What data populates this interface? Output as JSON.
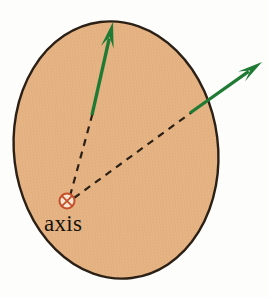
{
  "figure": {
    "kind": "physics-diagram",
    "title_text": "",
    "background_color": "#fdfdfb",
    "width": 268,
    "height": 298
  },
  "disk": {
    "name": "tilted-disk-ellipse",
    "fill_color": "#e7b485",
    "texture_color": "#d9a072",
    "stroke_color": "#2b2016",
    "stroke_width": 2.4,
    "center_x": 116,
    "center_y": 150,
    "radius_x": 102,
    "radius_y": 129,
    "rotation_deg": -7
  },
  "axis_marker": {
    "name": "rotation-axis-symbol",
    "glyph": "circle-with-x",
    "meaning": "axis-into-page",
    "x": 67,
    "y": 201,
    "radius": 7.5,
    "stroke_color": "#c4502a",
    "inner_color": "#c4502a",
    "fill_color": "#f7e4d2"
  },
  "labels": {
    "axis": "axis",
    "axis_x": 44,
    "axis_y": 231
  },
  "vectors": [
    {
      "name": "vector-arrow-1",
      "label": "",
      "color": "#1f7a34",
      "tail_x": 92,
      "tail_y": 115,
      "tip_x": 113,
      "tip_y": 22,
      "shaft_width": 3.4,
      "head_length": 26,
      "head_width": 13
    },
    {
      "name": "vector-arrow-2",
      "label": "",
      "color": "#1f7a34",
      "tail_x": 190,
      "tail_y": 113,
      "tip_x": 262,
      "tip_y": 62,
      "shaft_width": 3.2,
      "head_length": 25,
      "head_width": 12
    }
  ],
  "leader_lines": [
    {
      "name": "dashed-leader-to-vector-1",
      "from_x": 70,
      "from_y": 196,
      "to_x": 93,
      "to_y": 112,
      "color": "#2b2016",
      "dash": "7 6",
      "width": 2.2
    },
    {
      "name": "dashed-leader-to-vector-2",
      "from_x": 74,
      "from_y": 198,
      "to_x": 192,
      "to_y": 112,
      "color": "#2b2016",
      "dash": "7 6",
      "width": 2.2
    }
  ]
}
